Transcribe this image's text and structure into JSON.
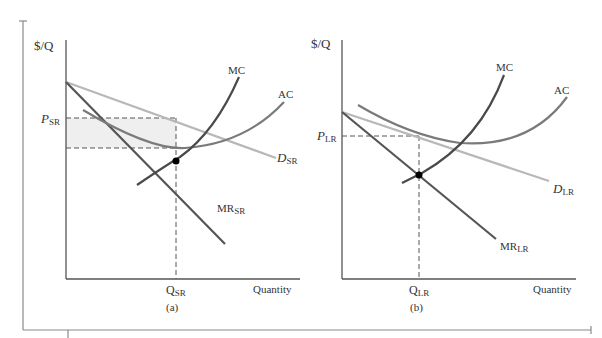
{
  "figure": {
    "frame_color": "#8a8a8a",
    "colors": {
      "axis": "#555555",
      "mc": "#4a4a4a",
      "mr": "#555555",
      "ac": "#7a7a7a",
      "demand": "#b8b8b8",
      "profit_area": "#efefef",
      "dashed": "#555555",
      "point": "#000000"
    }
  },
  "panel_a": {
    "caption": "(a)",
    "y_axis_label": "$/Q",
    "x_axis_label": "Quantity",
    "price_label": {
      "main": "P",
      "sub": "SR"
    },
    "quantity_label": {
      "main": "Q",
      "sub": "SR"
    },
    "curves": {
      "mc": {
        "label": "MC"
      },
      "ac": {
        "label": "AC"
      },
      "demand": {
        "main": "D",
        "sub": "SR"
      },
      "mr": {
        "main": "MR",
        "sub": "SR"
      }
    }
  },
  "panel_b": {
    "caption": "(b)",
    "y_axis_label": "$/Q",
    "x_axis_label": "Quantity",
    "price_label": {
      "main": "P",
      "sub": "LR"
    },
    "quantity_label": {
      "main": "Q",
      "sub": "LR"
    },
    "curves": {
      "mc": {
        "label": "MC"
      },
      "ac": {
        "label": "AC"
      },
      "demand": {
        "main": "D",
        "sub": "LR"
      },
      "mr": {
        "main": "MR",
        "sub": "LR"
      }
    }
  }
}
